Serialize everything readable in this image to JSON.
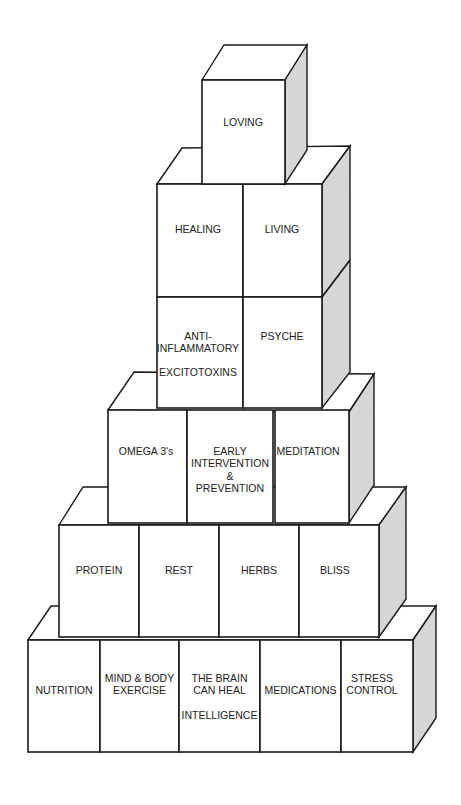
{
  "diagram": {
    "type": "block-pyramid",
    "colors": {
      "face": "#ffffff",
      "side": "#d6d6d6",
      "outline": "#1a1a1a",
      "text": "#222222"
    },
    "tiers": [
      {
        "level": 1,
        "blocks": [
          {
            "lines": [
              "LOVING"
            ]
          }
        ]
      },
      {
        "level": 2,
        "blocks": [
          {
            "lines": [
              "HEALING"
            ]
          },
          {
            "lines": [
              "LIVING"
            ]
          }
        ]
      },
      {
        "level": 3,
        "blocks": [
          {
            "lines": [
              "ANTI-",
              "INFLAMMATORY",
              "",
              "EXCITOTOXINS"
            ]
          },
          {
            "lines": [
              "PSYCHE"
            ]
          }
        ]
      },
      {
        "level": 4,
        "blocks": [
          {
            "lines": [
              "OMEGA 3's"
            ]
          },
          {
            "lines": [
              "EARLY",
              "INTERVENTION",
              "&",
              "PREVENTION"
            ]
          },
          {
            "lines": [
              "MEDITATION"
            ]
          }
        ]
      },
      {
        "level": 5,
        "blocks": [
          {
            "lines": [
              "PROTEIN"
            ]
          },
          {
            "lines": [
              "REST"
            ]
          },
          {
            "lines": [
              "HERBS"
            ]
          },
          {
            "lines": [
              "BLISS"
            ]
          }
        ]
      },
      {
        "level": 6,
        "blocks": [
          {
            "lines": [
              "NUTRITION"
            ]
          },
          {
            "lines": [
              "MIND & BODY",
              "EXERCISE"
            ]
          },
          {
            "lines": [
              "THE BRAIN",
              "CAN HEAL",
              "",
              "INTELLIGENCE"
            ]
          },
          {
            "lines": [
              "MEDICATIONS"
            ]
          },
          {
            "lines": [
              "STRESS",
              "CONTROL"
            ]
          }
        ]
      }
    ]
  }
}
